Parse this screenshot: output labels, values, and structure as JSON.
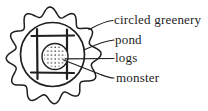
{
  "diagram": {
    "labels": {
      "greenery": {
        "text": "circled greenery",
        "target": "outer scalloped ring"
      },
      "pond": {
        "text": "pond",
        "target": "inner circle"
      },
      "logs": {
        "text": "logs",
        "target": "crossed log grid"
      },
      "monster": {
        "text": "monster",
        "target": "stippled circle"
      }
    },
    "colors": {
      "ink": "#1f1f1f",
      "text": "#232323",
      "background": "#ffffff"
    }
  }
}
